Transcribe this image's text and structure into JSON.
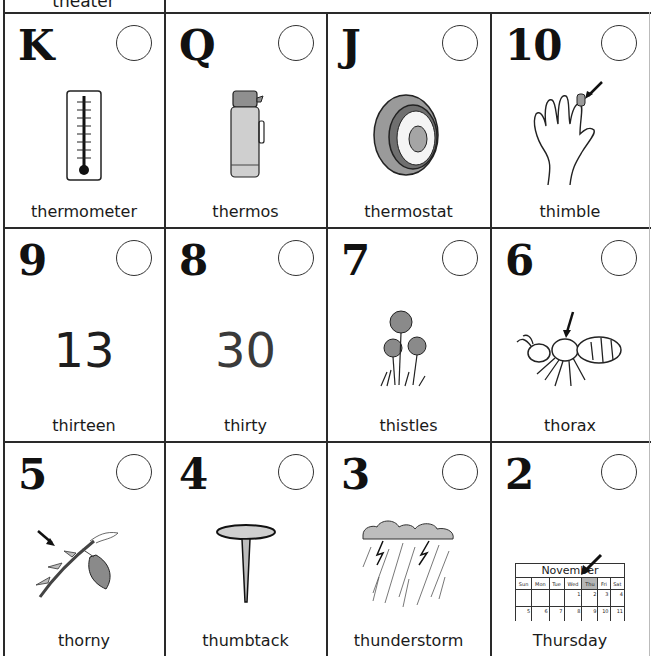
{
  "partial_top_card": {
    "word": "theater"
  },
  "cards": [
    {
      "index": "K",
      "word": "thermometer",
      "picture": "thermometer-icon"
    },
    {
      "index": "Q",
      "word": "thermos",
      "picture": "thermos-icon"
    },
    {
      "index": "J",
      "word": "thermostat",
      "picture": "thermostat-icon"
    },
    {
      "index": "10",
      "word": "thimble",
      "picture": "thimble-hand-icon"
    },
    {
      "index": "9",
      "word": "thirteen",
      "picture_text": "13"
    },
    {
      "index": "8",
      "word": "thirty",
      "picture_text": "30"
    },
    {
      "index": "7",
      "word": "thistles",
      "picture": "thistles-icon"
    },
    {
      "index": "6",
      "word": "thorax",
      "picture": "ant-thorax-icon"
    },
    {
      "index": "5",
      "word": "thorny",
      "picture": "thorny-stem-icon"
    },
    {
      "index": "4",
      "word": "thumbtack",
      "picture": "thumbtack-icon"
    },
    {
      "index": "3",
      "word": "thunderstorm",
      "picture": "thunderstorm-icon"
    },
    {
      "index": "2",
      "word": "Thursday",
      "picture": "calendar-icon"
    }
  ],
  "calendar": {
    "month": "November",
    "days": [
      "Sun",
      "Mon",
      "Tue",
      "Wed",
      "Thu",
      "Fri",
      "Sat"
    ],
    "week1": [
      "",
      "",
      "",
      "1",
      "2",
      "3",
      "4"
    ],
    "week2": [
      "5",
      "6",
      "7",
      "8",
      "9",
      "10",
      "11"
    ],
    "highlight_day": "Thu"
  },
  "colors": {
    "grid_line": "#2a2a2a",
    "illustration_gray": "#a9a9a9",
    "background": "#ffffff"
  }
}
